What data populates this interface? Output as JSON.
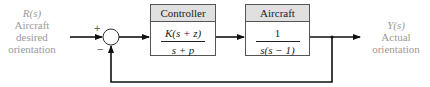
{
  "input": {
    "signal": "R(s)",
    "line1": "Aircraft",
    "line2": "desired",
    "line3": "orientation"
  },
  "output": {
    "signal": "Y(s)",
    "line1": "Actual",
    "line2": "orientation"
  },
  "summing_junction": {
    "plus": "+",
    "minus": "−"
  },
  "controller": {
    "title": "Controller",
    "numerator": "K(s + z)",
    "denominator": "s + p"
  },
  "plant": {
    "title": "Aircraft",
    "numerator": "1",
    "denominator": "s(s − 1)"
  }
}
